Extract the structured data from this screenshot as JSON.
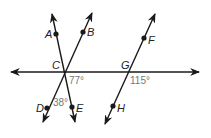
{
  "diagram": {
    "colors": {
      "line": "#1a1a1a",
      "angle_text": "#777777",
      "label_text": "#222222"
    },
    "points": [
      {
        "name": "A",
        "label": "A"
      },
      {
        "name": "B",
        "label": "B"
      },
      {
        "name": "C",
        "label": "C"
      },
      {
        "name": "D",
        "label": "D"
      },
      {
        "name": "E",
        "label": "E"
      },
      {
        "name": "F",
        "label": "F"
      },
      {
        "name": "G",
        "label": "G"
      },
      {
        "name": "H",
        "label": "H"
      }
    ],
    "angles": [
      {
        "name": "angle-at-C",
        "label": "77°"
      },
      {
        "name": "angle-DCE",
        "label": "38°"
      },
      {
        "name": "angle-at-G",
        "label": "115°"
      }
    ]
  }
}
